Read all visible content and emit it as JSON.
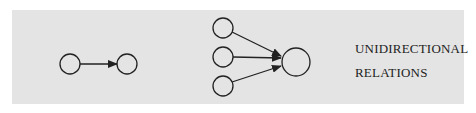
{
  "diagram": {
    "caption_lines": [
      "UNIDIRECTIONAL",
      "RELATIONS"
    ],
    "colors": {
      "background": "#e4e4e4",
      "stroke": "#222222"
    },
    "left_graph": {
      "nodes": [
        "a",
        "b"
      ],
      "edges": [
        {
          "from": "a",
          "to": "b",
          "directed": true
        }
      ]
    },
    "right_graph": {
      "nodes": [
        "s1",
        "s2",
        "s3",
        "t"
      ],
      "edges": [
        {
          "from": "s1",
          "to": "t",
          "directed": true
        },
        {
          "from": "s2",
          "to": "t",
          "directed": true
        },
        {
          "from": "s3",
          "to": "t",
          "directed": true
        }
      ]
    }
  }
}
